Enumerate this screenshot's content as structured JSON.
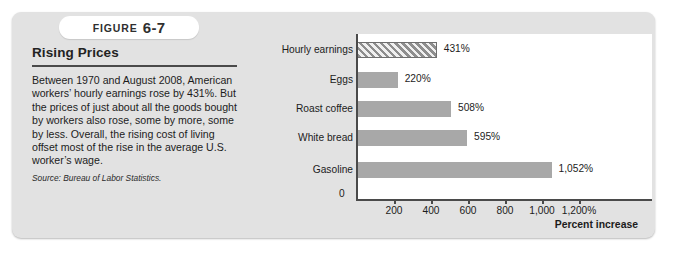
{
  "figure": {
    "badge_word": "FIGURE",
    "badge_number": "6-7",
    "title": "Rising Prices",
    "body": "Between 1970 and August 2008, American workers’ hourly earnings rose by 431%. But the prices of just about all the goods bought by workers also rose, some by more, some by less. Overall, the rising cost of living offset most of the rise in the average U.S. worker’s wage.",
    "source": "Source: Bureau of Labor Statistics."
  },
  "chart_data": {
    "type": "bar",
    "orientation": "horizontal",
    "title": "",
    "xlabel": "Percent increase",
    "ylabel": "",
    "xlim": [
      0,
      1200
    ],
    "grid": false,
    "legend": "none",
    "categories": [
      "Hourly earnings",
      "Eggs",
      "Roast coffee",
      "White bread",
      "Gasoline"
    ],
    "values": [
      431,
      220,
      508,
      595,
      1052
    ],
    "value_labels": [
      "431%",
      "220%",
      "508%",
      "595%",
      "1,052%"
    ],
    "tick_values": [
      0,
      200,
      400,
      600,
      800,
      1000,
      1200
    ],
    "tick_labels": [
      "0",
      "200",
      "400",
      "600",
      "800",
      "1,000",
      "1,200%"
    ],
    "zero_label": "0",
    "styles": [
      "hatched",
      "solid",
      "solid",
      "solid",
      "solid"
    ]
  },
  "colors": {
    "panel": "#e2e2e2",
    "bar": "#a8a8a8",
    "bar_hatch": "#8e8e8e",
    "axis": "#4a4a4a",
    "text": "#1c1c1c",
    "chart_bg": "#ffffff"
  }
}
